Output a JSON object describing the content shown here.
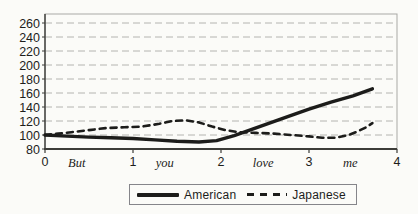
{
  "figure": {
    "background": "#fbfbf8",
    "accent_color": "#1c1c1a",
    "grid_color": "#b4b4b0",
    "frame_color": "#a9a9a5",
    "axis_color": "#3c3c38",
    "text_color": "#1d1d1b"
  },
  "chart_data": {
    "type": "line",
    "title": "",
    "xlabel": "",
    "ylabel": "",
    "xlim": [
      0,
      4
    ],
    "ylim": [
      80,
      260
    ],
    "grid": "horizontal",
    "legend_position": "bottom-center",
    "y_ticks": [
      80,
      100,
      120,
      140,
      160,
      180,
      200,
      220,
      240,
      260
    ],
    "x_number_ticks": [
      0,
      1,
      2,
      3,
      4
    ],
    "x_word_labels": [
      {
        "label": "But",
        "x": 0.36
      },
      {
        "label": "you",
        "x": 1.36
      },
      {
        "label": "love",
        "x": 2.48
      },
      {
        "label": "me",
        "x": 3.47
      }
    ],
    "series": [
      {
        "name": "American",
        "style": "solid",
        "color": "#1c1c1a",
        "width": 3.4,
        "points": [
          [
            0,
            100
          ],
          [
            0.25,
            98.5
          ],
          [
            0.5,
            97
          ],
          [
            0.75,
            96
          ],
          [
            1.0,
            95
          ],
          [
            1.25,
            93
          ],
          [
            1.5,
            91
          ],
          [
            1.75,
            90
          ],
          [
            1.95,
            92
          ],
          [
            2.15,
            99
          ],
          [
            2.35,
            108
          ],
          [
            2.55,
            117
          ],
          [
            2.75,
            126
          ],
          [
            3.0,
            137
          ],
          [
            3.25,
            147
          ],
          [
            3.5,
            156
          ],
          [
            3.72,
            166
          ]
        ]
      },
      {
        "name": "Japanese",
        "style": "dashed",
        "color": "#1c1c1a",
        "width": 2.6,
        "dash": "6 5",
        "points": [
          [
            0,
            100
          ],
          [
            0.15,
            102
          ],
          [
            0.3,
            104
          ],
          [
            0.5,
            107
          ],
          [
            0.7,
            110
          ],
          [
            0.9,
            111
          ],
          [
            1.1,
            112
          ],
          [
            1.3,
            116
          ],
          [
            1.45,
            120
          ],
          [
            1.6,
            121
          ],
          [
            1.75,
            118
          ],
          [
            1.9,
            112
          ],
          [
            2.05,
            107
          ],
          [
            2.2,
            104
          ],
          [
            2.4,
            103
          ],
          [
            2.6,
            102
          ],
          [
            2.8,
            100
          ],
          [
            3.0,
            98
          ],
          [
            3.15,
            96
          ],
          [
            3.3,
            96
          ],
          [
            3.45,
            100
          ],
          [
            3.55,
            105
          ],
          [
            3.65,
            111
          ],
          [
            3.72,
            117
          ]
        ]
      }
    ]
  }
}
